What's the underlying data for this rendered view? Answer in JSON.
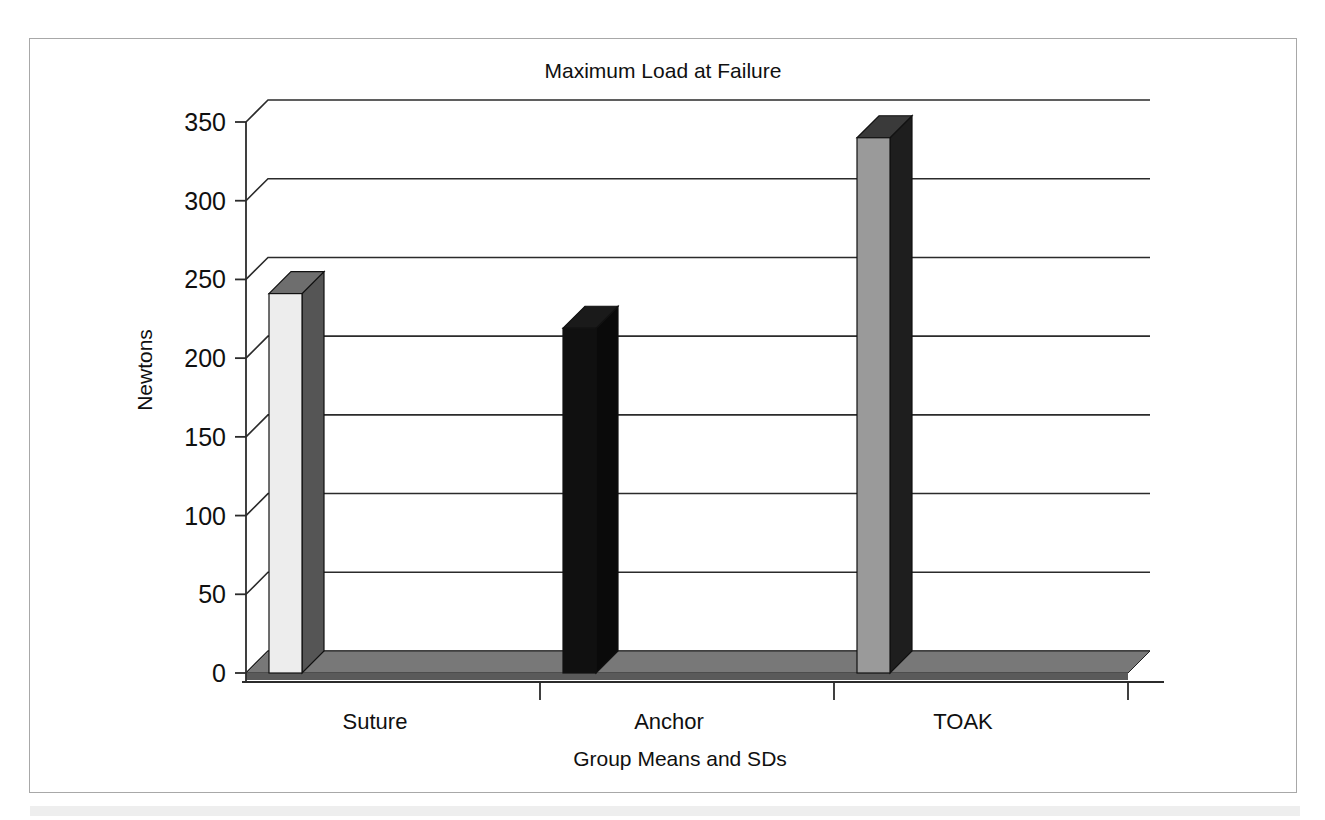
{
  "chart_data": {
    "type": "bar",
    "title": "Maximum Load at Failure",
    "xlabel": "Group Means and SDs",
    "ylabel": "Newtons",
    "categories": [
      "Suture",
      "Anchor",
      "TOAK"
    ],
    "values": [
      241,
      219,
      340
    ],
    "series": [
      {
        "name": "Maximum Load at Failure",
        "values": [
          241,
          219,
          340
        ]
      }
    ],
    "ylim": [
      0,
      350
    ],
    "yticks": [
      0,
      50,
      100,
      150,
      200,
      250,
      300,
      350
    ],
    "ytick_labels": [
      "0",
      "50",
      "100",
      "150",
      "200",
      "250",
      "300",
      "350"
    ],
    "grid": true,
    "legend": "none",
    "style": "3d-column",
    "bar_colors": [
      "#ededed",
      "#101010",
      "#9a9a9a"
    ],
    "bar_side_colors": [
      "#555555",
      "#0a0a0a",
      "#1e1e1e"
    ],
    "bar_top_colors": [
      "#6e6e6e",
      "#1a1a1a",
      "#3a3a3a"
    ],
    "floor_color": "#787878",
    "floor_front_color": "#5a5a5a",
    "annotations": []
  },
  "figure": {
    "frame_color": "#a8a8a8",
    "background": "#ffffff"
  }
}
